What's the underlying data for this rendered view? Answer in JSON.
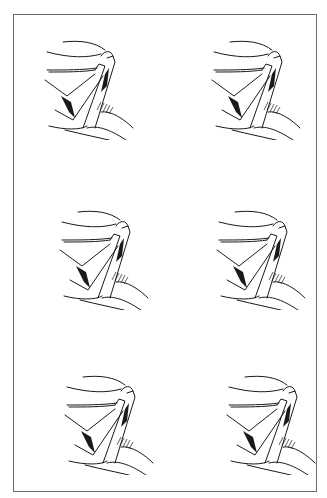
{
  "figure": {
    "caption": "",
    "frame": {
      "x": 13,
      "y": 14,
      "width": 304,
      "height": 478,
      "border_color": "#6a6a6a"
    },
    "ink_color": "#1a1a1a",
    "panels": [
      {
        "id": "panel-1",
        "row": 1,
        "col": 1,
        "x": 25,
        "y": 30,
        "variant": "ring-open-narrow"
      },
      {
        "id": "panel-2",
        "row": 1,
        "col": 2,
        "x": 190,
        "y": 30,
        "variant": "ring-open-double-lip"
      },
      {
        "id": "panel-3",
        "row": 2,
        "col": 1,
        "x": 40,
        "y": 200,
        "variant": "ring-flat-top"
      },
      {
        "id": "panel-4",
        "row": 2,
        "col": 2,
        "x": 195,
        "y": 200,
        "variant": "ring-flat-top-thin"
      },
      {
        "id": "panel-5",
        "row": 3,
        "col": 1,
        "x": 45,
        "y": 365,
        "variant": "ring-stepped"
      },
      {
        "id": "panel-6",
        "row": 3,
        "col": 2,
        "x": 205,
        "y": 365,
        "variant": "ring-double-hook"
      }
    ]
  }
}
